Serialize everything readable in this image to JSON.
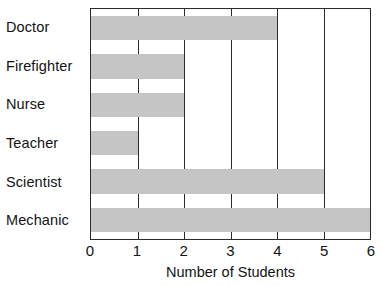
{
  "chart_data": {
    "type": "bar",
    "orientation": "horizontal",
    "title": "",
    "xlabel": "Number of Students",
    "ylabel": "",
    "categories": [
      "Doctor",
      "Firefighter",
      "Nurse",
      "Teacher",
      "Scientist",
      "Mechanic"
    ],
    "values": [
      4,
      2,
      2,
      1,
      5,
      6
    ],
    "xlim": [
      0,
      6
    ],
    "xticks": [
      0,
      1,
      2,
      3,
      4,
      5,
      6
    ],
    "xtick_labels": [
      "0",
      "1",
      "2",
      "3",
      "4",
      "5",
      "6"
    ],
    "grid": true,
    "grid_axis": "x",
    "legend": false,
    "bar_color": "#c5c5c5",
    "axis_color": "#2b2b2b",
    "text_color": "#131313",
    "background": "#ffffff"
  }
}
